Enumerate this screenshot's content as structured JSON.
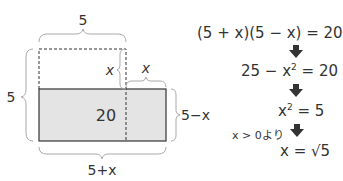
{
  "diagram": {
    "labels": {
      "top_width": "5",
      "left_height": "5",
      "cut_height": "x",
      "added_width": "x",
      "right_height": "5−x",
      "bottom_width": "5+x",
      "area": "20"
    },
    "colors": {
      "shaded_fill": "#e4e4e4",
      "stroke": "#333333",
      "brace": "#aaaaaa"
    }
  },
  "equations": {
    "step1": "(5 + x)(5 − x) = 20",
    "step2_pre": "25 − x",
    "step2_exp": "2",
    "step2_post": " = 20",
    "step3_pre": "x",
    "step3_exp": "2",
    "step3_post": " = 5",
    "condition": "x > 0より",
    "step4": "x = √5"
  }
}
